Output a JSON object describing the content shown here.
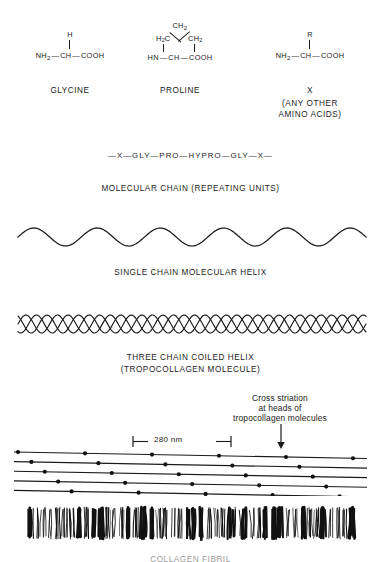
{
  "figure": {
    "ink_color": "#1a1a1a",
    "background": "#ffffff"
  },
  "amino_acids": [
    {
      "name": "glycine",
      "label": "GLYCINE",
      "side_group": "H",
      "backbone_left": "NH",
      "backbone_left_sub": "2",
      "backbone_center": "CH",
      "backbone_right": "COOH",
      "backbone_text": "NH2 — CH — COOH"
    },
    {
      "name": "proline",
      "label": "PROLINE",
      "ring_top": "CH",
      "ring_top_sub": "2",
      "ring_left": "H2C",
      "ring_right": "CH2",
      "backbone_left": "HN",
      "backbone_center": "CH",
      "backbone_right": "COOH",
      "backbone_text": "HN — CH — COOH"
    },
    {
      "name": "other-amino-acid",
      "label": "X",
      "sublabel_line1": "(ANY OTHER",
      "sublabel_line2": "AMINO ACIDS)",
      "side_group": "R",
      "backbone_left": "NH",
      "backbone_left_sub": "2",
      "backbone_center": "CH",
      "backbone_right": "COOH",
      "backbone_text": "NH2 — CH — COOH"
    }
  ],
  "molecular_chain": {
    "sequence": "—X—GLY—PRO—HYPRO—GLY—X—",
    "caption": "MOLECULAR CHAIN (REPEATING UNITS)"
  },
  "single_helix": {
    "caption": "SINGLE CHAIN MOLECULAR HELIX",
    "periods": 5.5,
    "amplitude": 9
  },
  "triple_helix": {
    "caption_line1": "THREE CHAIN COILED HELIX",
    "caption_line2": "(TROPOCOLLAGEN MOLECULE)",
    "strands": 3,
    "periods": 11,
    "amplitude": 9
  },
  "fibril_packing": {
    "annotation_line1": "Cross striation",
    "annotation_line2": "at heads of",
    "annotation_line3": "tropocollagen molecules",
    "measurement": "280 nm",
    "rows": 5,
    "dots_per_row": 6,
    "stagger_note": "quarter-stagger offset"
  },
  "collagen_fibril": {
    "caption": "COLLAGEN FIBRIL",
    "striation_count": 46
  }
}
